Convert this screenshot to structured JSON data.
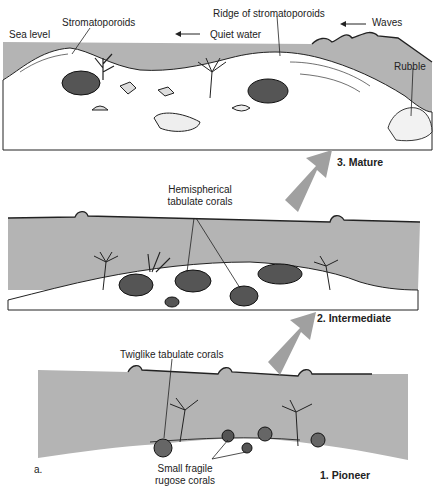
{
  "figure": {
    "panel_label": "a.",
    "stages": [
      {
        "id": "mature",
        "label": "3. Mature"
      },
      {
        "id": "intermediate",
        "label": "2. Intermediate"
      },
      {
        "id": "pioneer",
        "label": "1. Pioneer"
      }
    ],
    "mature_labels": {
      "sea_level": "Sea level",
      "stromatoporoids": "Stromatoporoids",
      "ridge": "Ridge of stromatoporoids",
      "quiet_water": "Quiet water",
      "waves": "Waves",
      "rubble": "Rubble"
    },
    "intermediate_labels": {
      "hemispherical_line1": "Hemispherical",
      "hemispherical_line2": "tabulate corals"
    },
    "pioneer_labels": {
      "twiglike": "Twiglike tabulate corals",
      "rugose_line1": "Small fragile",
      "rugose_line2": "rugose corals"
    },
    "colors": {
      "water": "#b4b4b4",
      "sediment": "#ffffff",
      "arrow": "#a0a0a0",
      "ink": "#222222"
    }
  }
}
